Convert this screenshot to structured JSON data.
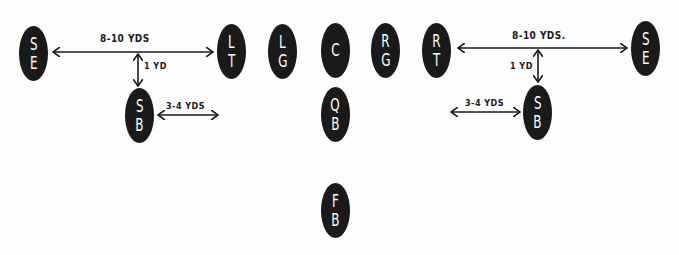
{
  "diagram": {
    "title": "",
    "background_color": "#fefefe",
    "player_color": "#1a1a1a",
    "players": [
      {
        "id": "se-left",
        "line1": "S",
        "line2": "E",
        "x": 19,
        "y": 26
      },
      {
        "id": "lt",
        "line1": "L",
        "line2": "T",
        "x": 217,
        "y": 24
      },
      {
        "id": "lg",
        "line1": "L",
        "line2": "G",
        "x": 268,
        "y": 24
      },
      {
        "id": "c",
        "line1": "C",
        "line2": "",
        "x": 321,
        "y": 23
      },
      {
        "id": "rg",
        "line1": "R",
        "line2": "G",
        "x": 371,
        "y": 23
      },
      {
        "id": "rt",
        "line1": "R",
        "line2": "T",
        "x": 422,
        "y": 23
      },
      {
        "id": "se-right",
        "line1": "S",
        "line2": "E",
        "x": 631,
        "y": 21
      },
      {
        "id": "sb-left",
        "line1": "S",
        "line2": "B",
        "x": 125,
        "y": 88
      },
      {
        "id": "qb",
        "line1": "Q",
        "line2": "B",
        "x": 321,
        "y": 87
      },
      {
        "id": "sb-right",
        "line1": "S",
        "line2": "B",
        "x": 523,
        "y": 85
      },
      {
        "id": "fb",
        "line1": "F",
        "line2": "B",
        "x": 321,
        "y": 183
      }
    ],
    "labels": {
      "left_split": "8-10 YDS",
      "left_depth": "1 YD",
      "left_sb_offset": "3-4 YDS",
      "right_split": "8-10 YDS.",
      "right_depth": "1 YD",
      "right_sb_offset": "3-4 YDS"
    }
  }
}
